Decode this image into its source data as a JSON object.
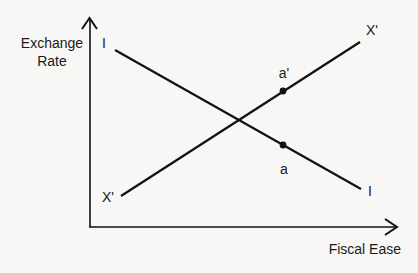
{
  "diagram": {
    "y_axis_label_line1": "Exchange",
    "y_axis_label_line2": "Rate",
    "x_axis_label": "Fiscal Ease",
    "curves": [
      {
        "name": "I",
        "start_label": "I",
        "end_label": "I",
        "slope": "downward"
      },
      {
        "name": "X'",
        "start_label": "X'",
        "end_label": "X'",
        "slope": "upward"
      }
    ],
    "points": [
      {
        "label": "a'",
        "on_curve": "X'"
      },
      {
        "label": "a",
        "on_curve": "I"
      }
    ],
    "colors": {
      "line": "#111111",
      "background": "#f7f7f5"
    }
  }
}
